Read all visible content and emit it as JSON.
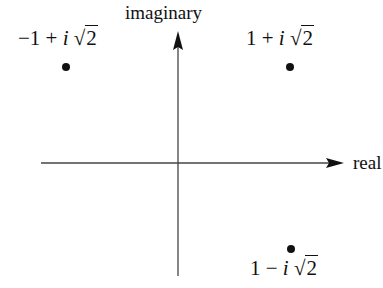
{
  "diagram": {
    "axes": {
      "horizontal_label": "real",
      "vertical_label": "imaginary",
      "origin": [
        178,
        163
      ],
      "line_color": "#444444"
    },
    "points": [
      {
        "id": "p1",
        "real_part": "−1",
        "op": "+",
        "imag": "i",
        "root_sign": "√",
        "root_arg": "2",
        "x": 66,
        "y": 67
      },
      {
        "id": "p2",
        "real_part": "1",
        "op": "+",
        "imag": "i",
        "root_sign": "√",
        "root_arg": "2",
        "x": 290,
        "y": 67
      },
      {
        "id": "p3",
        "real_part": "1",
        "op": "−",
        "imag": "i",
        "root_sign": "√",
        "root_arg": "2",
        "x": 291,
        "y": 249
      }
    ]
  }
}
